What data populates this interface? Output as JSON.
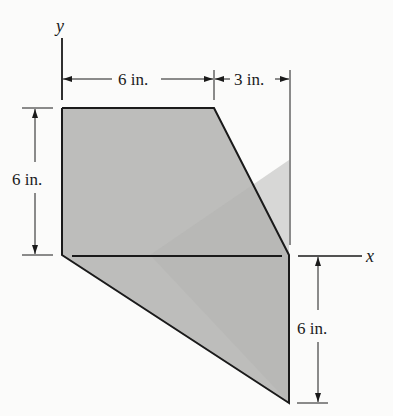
{
  "figure": {
    "type": "engineering area diagram",
    "axes": {
      "x_label": "x",
      "y_label": "y"
    },
    "dimensions": {
      "top_left_width": "6 in.",
      "top_right_width": "3 in.",
      "left_height": "6 in.",
      "right_lower_height": "6 in."
    },
    "shape": {
      "description": "Shaded area bounded by the y-axis from (0,6) down to origin, top edge from (0,6) to (6,6), slanted edge from (6,6) to (9,0), vertical edge from (9,0) to (9,-6), and slanted edge from (9,-6) back to origin",
      "vertices_in": [
        [
          0,
          6
        ],
        [
          6,
          6
        ],
        [
          9,
          0
        ],
        [
          9,
          -6
        ],
        [
          0,
          0
        ]
      ],
      "fill_color": "#b9b9b7",
      "stroke_color": "#1a1a1a"
    }
  }
}
